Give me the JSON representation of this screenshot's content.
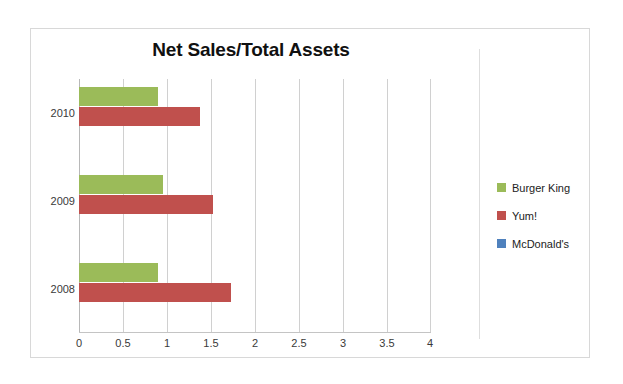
{
  "chart_data": {
    "type": "bar",
    "orientation": "horizontal",
    "title": "Net Sales/Total Assets",
    "xlabel": "",
    "ylabel": "",
    "categories": [
      "2010",
      "2009",
      "2008"
    ],
    "series": [
      {
        "name": "Burger King",
        "color": "#9BBB59",
        "values": [
          0.9,
          0.95,
          0.9
        ]
      },
      {
        "name": "Yum!",
        "color": "#C0504D",
        "values": [
          1.37,
          1.52,
          1.73
        ]
      },
      {
        "name": "McDonald's",
        "color": "#4F81BD",
        "values": [
          3.5,
          0.75,
          0.83
        ]
      }
    ],
    "xlim": [
      0,
      4
    ],
    "xticks": [
      "0",
      "0.5",
      "1",
      "1.5",
      "2",
      "2.5",
      "3",
      "3.5",
      "4"
    ],
    "xtick_values": [
      0,
      0.5,
      1,
      1.5,
      2,
      2.5,
      3,
      3.5,
      4
    ],
    "grid": "vertical",
    "legend_position": "right"
  },
  "legend": {
    "items": [
      {
        "label": "Burger King",
        "color": "#9BBB59"
      },
      {
        "label": "Yum!",
        "color": "#C0504D"
      },
      {
        "label": "McDonald's",
        "color": "#4F81BD"
      }
    ]
  },
  "axis": {
    "x_ticks": [
      "0",
      "0.5",
      "1",
      "1.5",
      "2",
      "2.5",
      "3",
      "3.5",
      "4"
    ],
    "y_categories": [
      "2010",
      "2009",
      "2008"
    ]
  }
}
